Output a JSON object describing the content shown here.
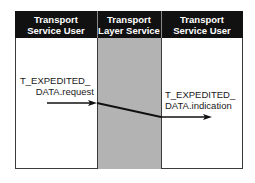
{
  "diagram": {
    "columns": [
      {
        "line1": "Transport",
        "line2": "Service User"
      },
      {
        "line1": "Transport",
        "line2": "Layer Service"
      },
      {
        "line1": "Transport",
        "line2": "Service User"
      }
    ],
    "request_label": {
      "line1": "T_EXPEDITED_",
      "line2": "DATA.request"
    },
    "indication_label": {
      "line1": "T_EXPEDITED_",
      "line2": "DATA.indication"
    },
    "colors": {
      "header_bg": "#111111",
      "header_text": "#ffffff",
      "middle_shade": "#b3b3b3",
      "border": "#3a3a3a",
      "arrow": "#111111"
    }
  }
}
